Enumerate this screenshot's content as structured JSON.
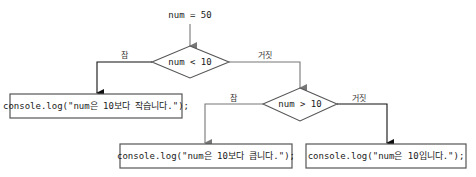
{
  "diagram": {
    "type": "flowchart",
    "start": {
      "id": "start",
      "text": "num = 50"
    },
    "decisions": [
      {
        "id": "cond1",
        "text": "num < 10"
      },
      {
        "id": "cond2",
        "text": "num > 10"
      }
    ],
    "processes": [
      {
        "id": "out_small",
        "text": "console.log(\"num은 10보다 작습니다.\");"
      },
      {
        "id": "out_big",
        "text": "console.log(\"num은 10보다 큽니다.\");"
      },
      {
        "id": "out_equal",
        "text": "console.log(\"num은 10입니다.\");"
      }
    ],
    "edges": [
      {
        "from": "start",
        "to": "cond1",
        "label": "",
        "color": "#777777"
      },
      {
        "from": "cond1",
        "to": "out_small",
        "label": "참",
        "color": "#111111"
      },
      {
        "from": "cond1",
        "to": "cond2",
        "label": "거짓",
        "color": "#777777"
      },
      {
        "from": "cond2",
        "to": "out_big",
        "label": "참",
        "color": "#777777"
      },
      {
        "from": "cond2",
        "to": "out_equal",
        "label": "거짓",
        "color": "#111111"
      }
    ]
  }
}
